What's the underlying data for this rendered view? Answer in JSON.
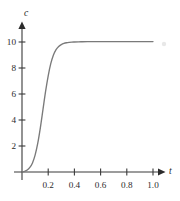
{
  "figure": {
    "background_color": "#ffffff",
    "axis_color": "#3a3a3a",
    "curve_color": "#7a7a7a",
    "text_color": "#2b2b2b"
  },
  "chart_data": {
    "type": "line",
    "title": "",
    "subtitle": "",
    "xlabel": "t",
    "ylabel": "c",
    "xlim": [
      0,
      1.08
    ],
    "ylim": [
      0,
      11.4
    ],
    "grid": false,
    "legend": null,
    "x_ticks": [
      0.2,
      0.4,
      0.6,
      0.8,
      1.0
    ],
    "x_tick_labels": [
      "0.2",
      "0.4",
      "0.6",
      "0.8",
      "1.0"
    ],
    "y_ticks": [
      2,
      4,
      6,
      8,
      10
    ],
    "y_tick_labels": [
      "2",
      "4",
      "6",
      "8",
      "10"
    ],
    "annotations": [],
    "series": [
      {
        "name": "c(t)",
        "color": "#7a7a7a",
        "x": [
          0.0,
          0.02,
          0.04,
          0.06,
          0.08,
          0.1,
          0.12,
          0.14,
          0.16,
          0.18,
          0.2,
          0.22,
          0.24,
          0.26,
          0.28,
          0.3,
          0.32,
          0.34,
          0.36,
          0.38,
          0.4,
          0.45,
          0.5,
          0.6,
          0.7,
          0.8,
          0.9,
          1.0
        ],
        "y": [
          0.0,
          0.05,
          0.15,
          0.35,
          0.7,
          1.3,
          2.2,
          3.4,
          4.8,
          6.2,
          7.4,
          8.35,
          9.0,
          9.42,
          9.66,
          9.8,
          9.89,
          9.94,
          9.97,
          9.99,
          10.0,
          10.02,
          10.03,
          10.03,
          10.03,
          10.03,
          10.03,
          10.03
        ]
      }
    ]
  },
  "axis_labels": {
    "y_axis_name": "c",
    "x_axis_name": "t"
  }
}
